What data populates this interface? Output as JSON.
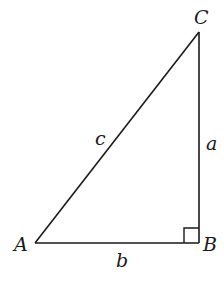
{
  "diagram": {
    "type": "right-triangle",
    "colors": {
      "stroke": "#1a1a1a",
      "background": "#ffffff"
    },
    "vertices": {
      "A": {
        "label": "A",
        "x": 35,
        "y": 243
      },
      "B": {
        "label": "B",
        "x": 199,
        "y": 243
      },
      "C": {
        "label": "C",
        "x": 199,
        "y": 32
      }
    },
    "sides": {
      "a": {
        "label": "a",
        "between": [
          "B",
          "C"
        ]
      },
      "b": {
        "label": "b",
        "between": [
          "A",
          "B"
        ]
      },
      "c": {
        "label": "c",
        "between": [
          "A",
          "C"
        ]
      }
    },
    "right_angle_at": "B"
  }
}
